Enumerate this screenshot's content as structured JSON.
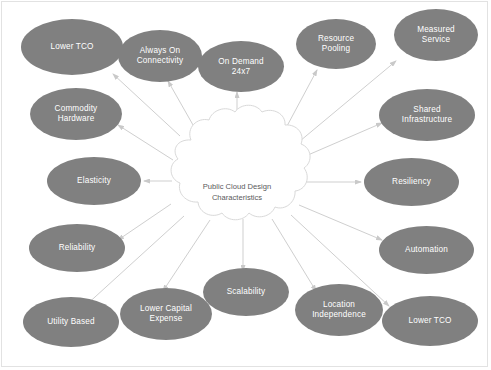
{
  "diagram": {
    "title": "Public Cloud Design Characteristics",
    "hub": {
      "shape": "cloud-shape",
      "label": "Public Cloud Design\nCharacteristics",
      "fill": "#ffffff",
      "stroke": "#d9d9d9",
      "text_color": "#59595b",
      "center": [
        237,
        183
      ]
    },
    "style": {
      "node_fill": "#808080",
      "node_text": "#ffffff",
      "connector_color": "#cfcfcf",
      "background": "#ffffff",
      "frame_border": "#e2e2e2"
    },
    "nodes": [
      {
        "id": "lower-tco-top",
        "label": "Lower TCO",
        "x": 21,
        "y": 19,
        "w": 102,
        "h": 56,
        "arrow_to": [
          113,
          74
        ],
        "arrow_from": [
          180,
          136
        ]
      },
      {
        "id": "always-on",
        "label": "Always On\nConnectivity",
        "x": 118,
        "y": 30,
        "w": 84,
        "h": 52,
        "arrow_to": [
          168,
          81
        ],
        "arrow_from": [
          201,
          139
        ]
      },
      {
        "id": "on-demand",
        "label": "On Demand\n24x7",
        "x": 198,
        "y": 41,
        "w": 86,
        "h": 51,
        "arrow_to": [
          237,
          92
        ],
        "arrow_from": [
          237,
          140
        ]
      },
      {
        "id": "resource-pooling",
        "label": "Resource\nPooling",
        "x": 296,
        "y": 19,
        "w": 80,
        "h": 50,
        "arrow_to": [
          317,
          70
        ],
        "arrow_from": [
          279,
          141
        ]
      },
      {
        "id": "measured-service",
        "label": "Measured\nService",
        "x": 394,
        "y": 9,
        "w": 84,
        "h": 52,
        "arrow_to": [
          396,
          61
        ],
        "arrow_from": [
          294,
          146
        ]
      },
      {
        "id": "shared-infrastructure",
        "label": "Shared\nInfrastructure",
        "x": 379,
        "y": 89,
        "w": 96,
        "h": 52,
        "arrow_to": [
          382,
          123
        ],
        "arrow_from": [
          301,
          158
        ]
      },
      {
        "id": "resiliency",
        "label": "Resiliency",
        "x": 364,
        "y": 158,
        "w": 95,
        "h": 48,
        "arrow_to": [
          361,
          182
        ],
        "arrow_from": [
          305,
          182
        ]
      },
      {
        "id": "automation",
        "label": "Automation",
        "x": 379,
        "y": 226,
        "w": 95,
        "h": 48,
        "arrow_to": [
          382,
          240
        ],
        "arrow_from": [
          299,
          205
        ]
      },
      {
        "id": "lower-tco-bottom",
        "label": "Lower TCO",
        "x": 382,
        "y": 296,
        "w": 96,
        "h": 50,
        "arrow_to": [
          389,
          306
        ],
        "arrow_from": [
          291,
          215
        ]
      },
      {
        "id": "location-independence",
        "label": "Location\nIndependence",
        "x": 295,
        "y": 284,
        "w": 88,
        "h": 52,
        "arrow_to": [
          316,
          291
        ],
        "arrow_from": [
          272,
          219
        ]
      },
      {
        "id": "scalability",
        "label": "Scalability",
        "x": 203,
        "y": 268,
        "w": 86,
        "h": 48,
        "arrow_to": [
          243,
          271
        ],
        "arrow_from": [
          243,
          219
        ]
      },
      {
        "id": "lower-capital",
        "label": "Lower Capital\nExpense",
        "x": 120,
        "y": 288,
        "w": 92,
        "h": 52,
        "arrow_to": [
          163,
          291
        ],
        "arrow_from": [
          210,
          220
        ]
      },
      {
        "id": "utility-based",
        "label": "Utility Based",
        "x": 23,
        "y": 297,
        "w": 96,
        "h": 50,
        "arrow_to": [
          84,
          307
        ],
        "arrow_from": [
          184,
          216
        ]
      },
      {
        "id": "reliability",
        "label": "Reliability",
        "x": 29,
        "y": 224,
        "w": 96,
        "h": 48,
        "arrow_to": [
          118,
          240
        ],
        "arrow_from": [
          171,
          204
        ]
      },
      {
        "id": "elasticity",
        "label": "Elasticity",
        "x": 47,
        "y": 157,
        "w": 94,
        "h": 48,
        "arrow_to": [
          144,
          181
        ],
        "arrow_from": [
          172,
          181
        ]
      },
      {
        "id": "commodity-hardware",
        "label": "Commodity\nHardware",
        "x": 30,
        "y": 88,
        "w": 92,
        "h": 52,
        "arrow_to": [
          118,
          125
        ],
        "arrow_from": [
          173,
          160
        ]
      }
    ]
  }
}
